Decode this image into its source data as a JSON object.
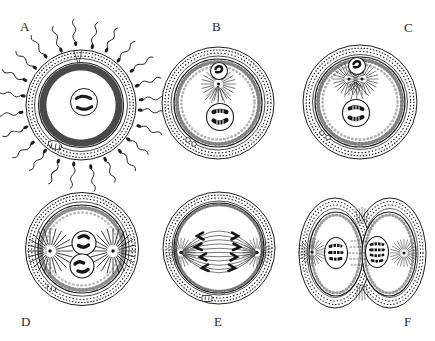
{
  "figure": {
    "colors": {
      "background": "#ffffff",
      "ink": "#1c1c1c"
    },
    "panels": [
      {
        "label": "A"
      },
      {
        "label": "B"
      },
      {
        "label": "C"
      },
      {
        "label": "D"
      },
      {
        "label": "E"
      },
      {
        "label": "F"
      }
    ]
  }
}
